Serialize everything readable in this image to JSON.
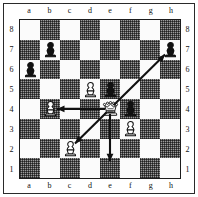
{
  "diagram": {
    "kind": "chess-board-diagram",
    "orientation": "white-bottom",
    "files": [
      "a",
      "b",
      "c",
      "d",
      "e",
      "f",
      "g",
      "h"
    ],
    "ranks": [
      "8",
      "7",
      "6",
      "5",
      "4",
      "3",
      "2",
      "1"
    ],
    "colors": {
      "light_square": "#fbfbfb",
      "dark_square": "#9b9b9b",
      "border": "#1c1c1c",
      "label": "#111111",
      "arrow": "#111111"
    },
    "pieces": [
      {
        "square": "b7",
        "color": "black",
        "type": "pawn",
        "glyph": "♟"
      },
      {
        "square": "h7",
        "color": "black",
        "type": "pawn",
        "glyph": "♟"
      },
      {
        "square": "a6",
        "color": "black",
        "type": "pawn",
        "glyph": "♟"
      },
      {
        "square": "d5",
        "color": "white",
        "type": "pawn",
        "glyph": "♙"
      },
      {
        "square": "e5",
        "color": "black",
        "type": "pawn",
        "glyph": "♟"
      },
      {
        "square": "b4",
        "color": "white",
        "type": "pawn",
        "glyph": "♙"
      },
      {
        "square": "e4",
        "color": "white",
        "type": "queen",
        "glyph": "♕"
      },
      {
        "square": "f4",
        "color": "black",
        "type": "pawn",
        "glyph": "♟"
      },
      {
        "square": "f3",
        "color": "white",
        "type": "pawn",
        "glyph": "♙"
      },
      {
        "square": "c2",
        "color": "white",
        "type": "pawn",
        "glyph": "♙"
      }
    ],
    "arrows": [
      {
        "from": "e4",
        "to": "h7",
        "direction": "up-right",
        "label": "Qe4-h7 diagonal"
      },
      {
        "from": "e4",
        "to": "b4",
        "direction": "left",
        "label": "Qe4-b4 rank"
      },
      {
        "from": "e4",
        "to": "c2",
        "direction": "down-left",
        "label": "Qe4-c2 diagonal"
      },
      {
        "from": "e4",
        "to": "e1",
        "direction": "down",
        "label": "Qe4-e1 file"
      }
    ]
  }
}
